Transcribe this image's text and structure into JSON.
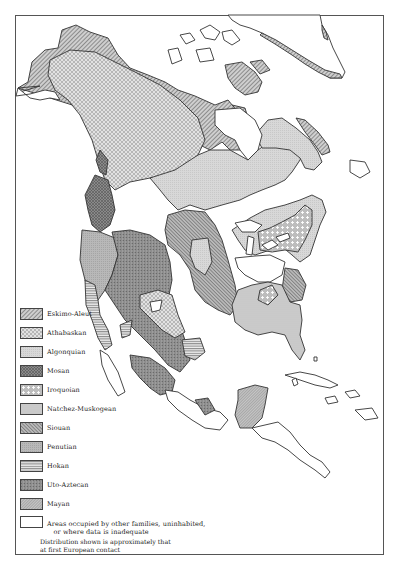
{
  "map": {
    "subject": "Native American language families of North America",
    "colors": {
      "outline": "#333333",
      "eskimo_aleut": "#a8a8a8",
      "athabaskan": "#d6d6d6",
      "algonquian": "#d4d4d4",
      "mosan": "#7f7f7f",
      "iroquoian": "#c2c2c2",
      "natchez_muskogean": "#d0d0d0",
      "siouan": "#959595",
      "penutian": "#b3b3b3",
      "hokan": "#c8c8c8",
      "uto_aztecan": "#8c8c8c",
      "mayan": "#b0b0b0",
      "other": "#ffffff"
    }
  },
  "legend": {
    "items": [
      {
        "key": "eskimo_aleut",
        "label": "Eskimo-Aleut",
        "pattern": "diagonal-hatch"
      },
      {
        "key": "athabaskan",
        "label": "Athabaskan",
        "pattern": "cross-hatch-light"
      },
      {
        "key": "algonquian",
        "label": "Algonquian",
        "pattern": "light-stipple"
      },
      {
        "key": "mosan",
        "label": "Mosan",
        "pattern": "dark-crosshatch"
      },
      {
        "key": "iroquoian",
        "label": "Iroquoian",
        "pattern": "crosses"
      },
      {
        "key": "natchez_muskogean",
        "label": "Natchez-Muskogean",
        "pattern": "fine-dots"
      },
      {
        "key": "siouan",
        "label": "Siouan",
        "pattern": "dense-diagonal"
      },
      {
        "key": "penutian",
        "label": "Penutian",
        "pattern": "medium-stipple"
      },
      {
        "key": "hokan",
        "label": "Hokan",
        "pattern": "horizontal-lines"
      },
      {
        "key": "uto_aztecan",
        "label": "Uto-Aztecan",
        "pattern": "dark-mottled"
      },
      {
        "key": "mayan",
        "label": "Mayan",
        "pattern": "fine-diagonal"
      },
      {
        "key": "other",
        "label": "Areas occupied by other families, uninhabited,\n   or where data is inadequate",
        "pattern": "blank"
      }
    ],
    "note": "Distribution shown is approximately that\nat first European contact"
  }
}
